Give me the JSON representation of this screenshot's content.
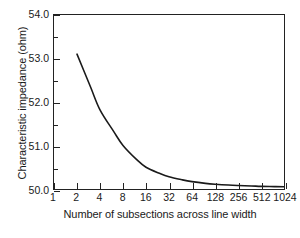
{
  "chart_data": {
    "type": "line",
    "title": "",
    "xlabel": "Number of subsections across line width",
    "ylabel": "Characteristic impedance (ohm)",
    "xscale": "log2",
    "xlim": [
      1,
      1024
    ],
    "ylim": [
      50.0,
      54.0
    ],
    "grid": false,
    "legend": null,
    "xticks": [
      1,
      2,
      4,
      8,
      16,
      32,
      64,
      128,
      256,
      512,
      1024
    ],
    "xtick_labels": [
      "1",
      "2",
      "4",
      "8",
      "16",
      "32",
      "64",
      "128",
      "256",
      "512",
      "1024"
    ],
    "yticks": [
      50.0,
      51.0,
      52.0,
      53.0,
      54.0
    ],
    "ytick_labels": [
      "50.0",
      "51.0",
      "52.0",
      "53.0",
      "54.0"
    ],
    "yminor_ticks": [
      50.5,
      51.5,
      52.5,
      53.5
    ],
    "line_color": "#1a1a1a",
    "line_width": 1.6,
    "series": [
      {
        "name": "Characteristic impedance",
        "x": [
          2,
          3,
          4,
          6,
          8,
          12,
          16,
          24,
          32,
          48,
          64,
          96,
          128,
          192,
          256,
          384,
          512,
          768,
          1024
        ],
        "y": [
          53.1,
          52.35,
          51.82,
          51.33,
          51.0,
          50.68,
          50.5,
          50.36,
          50.28,
          50.21,
          50.17,
          50.13,
          50.11,
          50.09,
          50.08,
          50.07,
          50.06,
          50.055,
          50.05
        ]
      }
    ]
  },
  "axis": {
    "ylabel": "Characteristic impedance (ohm)",
    "xlabel": "Number of subsections across line width"
  }
}
